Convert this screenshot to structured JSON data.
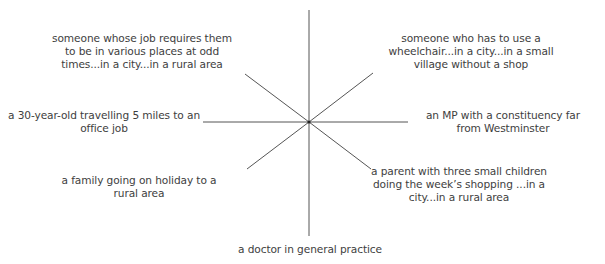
{
  "diagram": {
    "type": "spoke-diagram",
    "center": {
      "x": 309,
      "y": 122
    },
    "line_color": "#555555",
    "text_color": "#3e3e3e",
    "spokes": [
      {
        "id": "top",
        "x1": 309,
        "y1": 10,
        "x2": 309,
        "y2": 122
      },
      {
        "id": "bottom",
        "x1": 309,
        "y1": 122,
        "x2": 309,
        "y2": 236
      },
      {
        "id": "left",
        "x1": 203,
        "y1": 122,
        "x2": 309,
        "y2": 122
      },
      {
        "id": "right",
        "x1": 309,
        "y1": 122,
        "x2": 408,
        "y2": 122
      },
      {
        "id": "upper-left",
        "x1": 245,
        "y1": 74,
        "x2": 309,
        "y2": 122
      },
      {
        "id": "upper-right",
        "x1": 309,
        "y1": 122,
        "x2": 373,
        "y2": 73
      },
      {
        "id": "lower-left",
        "x1": 247,
        "y1": 169,
        "x2": 309,
        "y2": 122
      },
      {
        "id": "lower-right",
        "x1": 309,
        "y1": 122,
        "x2": 371,
        "y2": 169
      }
    ],
    "labels": {
      "upper_left": "someone whose job requires them to be in various places at odd times...in a city...in a rural area",
      "upper_right": "someone who has to use a wheelchair...in a city...in a small village without a shop",
      "left": "a 30-year-old travelling 5 miles to an office job",
      "right": "an MP with a constituency far from Westminster",
      "lower_left": "a family going on holiday to a rural area",
      "lower_right": "a parent with three small children doing the week’s shopping ...in a city...in a rural area",
      "bottom": "a doctor in general practice"
    }
  }
}
